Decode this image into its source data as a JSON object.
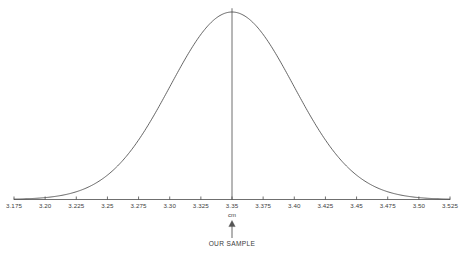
{
  "figure": {
    "background_color": "#ffffff",
    "curve_color": "#4a4a4a",
    "axis_color": "#4a4a4a",
    "text_color": "#3d3d3d",
    "unit_label": "cm",
    "annotation_label": "OUR SAMPLE",
    "annotation_arrow": "up-arrow"
  },
  "chart_data": {
    "type": "line",
    "title": "",
    "subtitle": "",
    "xlabel": "cm",
    "ylabel": "",
    "grid": false,
    "legend": false,
    "legend_position": "none",
    "distribution": "normal",
    "mean": 3.35,
    "std_dev": 0.0495,
    "xlim": [
      3.175,
      3.525
    ],
    "ylim": [
      0,
      1
    ],
    "tick_labels": [
      "3.175",
      "3.20",
      "3.225",
      "3.25",
      "3.275",
      "3.30",
      "3.325",
      "3.35",
      "3.375",
      "3.40",
      "3.425",
      "3.45",
      "3.475",
      "3.50",
      "3.525"
    ],
    "tick_values": [
      3.175,
      3.2,
      3.225,
      3.25,
      3.275,
      3.3,
      3.325,
      3.35,
      3.375,
      3.4,
      3.425,
      3.45,
      3.475,
      3.5,
      3.525
    ],
    "annotations": [
      {
        "text": "OUR SAMPLE",
        "x": 3.35,
        "arrow": "up",
        "target": "axis"
      }
    ],
    "markers": [
      {
        "type": "vertical-line",
        "x": 3.35,
        "from_y": 0,
        "to_y": 1.02
      }
    ],
    "x": [
      3.175,
      3.1875,
      3.2,
      3.2125,
      3.225,
      3.2375,
      3.25,
      3.2625,
      3.275,
      3.2875,
      3.3,
      3.3125,
      3.325,
      3.3375,
      3.35,
      3.3625,
      3.375,
      3.3875,
      3.4,
      3.4125,
      3.425,
      3.4375,
      3.45,
      3.4625,
      3.475,
      3.4875,
      3.5,
      3.5125,
      3.525
    ],
    "y": [
      0.005,
      0.011,
      0.024,
      0.047,
      0.086,
      0.147,
      0.234,
      0.347,
      0.482,
      0.624,
      0.757,
      0.866,
      0.944,
      0.987,
      1.0,
      0.987,
      0.944,
      0.866,
      0.757,
      0.624,
      0.482,
      0.347,
      0.234,
      0.147,
      0.086,
      0.047,
      0.024,
      0.011,
      0.005
    ]
  }
}
